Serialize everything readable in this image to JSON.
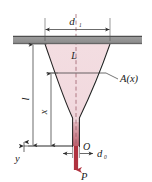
{
  "figure": {
    "labels": {
      "top_diameter": "d",
      "top_diameter_sub": "1",
      "bottom_diameter": "d",
      "bottom_diameter_sub": "0",
      "total_length": "l",
      "distance_x": "x",
      "interior_length": "L",
      "area_function": "A(x)",
      "origin": "O",
      "axis_y": "y",
      "force": "P"
    },
    "colors": {
      "body_fill": "#f3dfe2",
      "body_fill_dark": "#e8c3c8",
      "stem_fill": "#c9737d",
      "outline": "#232323",
      "support_bar": "#8c8c8c",
      "support_bar_edge": "#5e5e5e",
      "force_arrow": "#b03240",
      "centerline": "#9a5a66",
      "dimension_line": "#2b2b2b"
    },
    "geometry": {
      "support_bar_y": 36,
      "support_bar_height": 8,
      "top_width_left_x": 45,
      "top_width_right_x": 110,
      "bottom_tip_y": 146,
      "stem_width": 5,
      "center_x": 75,
      "section_y": 73
    }
  }
}
